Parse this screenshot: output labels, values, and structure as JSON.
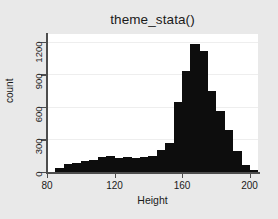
{
  "chart_data": {
    "type": "bar",
    "title": "theme_stata()",
    "xlabel": "Height",
    "ylabel": "count",
    "xlim": [
      80,
      205
    ],
    "ylim": [
      0,
      1270
    ],
    "xticks": [
      80,
      120,
      160,
      200
    ],
    "xtick_labels": [
      "80",
      "120",
      "160",
      "200"
    ],
    "yticks": [
      0,
      300,
      600,
      900,
      1200
    ],
    "ytick_labels": [
      "0",
      "300",
      "600",
      "900",
      "1200"
    ],
    "grid": "horizontal",
    "legend": "none",
    "bin_width": 5,
    "bin_starts": [
      85,
      90,
      95,
      100,
      105,
      110,
      115,
      120,
      125,
      130,
      135,
      140,
      145,
      150,
      155,
      160,
      165,
      170,
      175,
      180,
      185,
      190,
      195,
      200
    ],
    "values": [
      40,
      70,
      85,
      100,
      115,
      140,
      150,
      130,
      135,
      130,
      135,
      145,
      200,
      270,
      640,
      930,
      1180,
      1115,
      745,
      560,
      390,
      190,
      60,
      15
    ],
    "colors": {
      "bar": "#0d0d0d",
      "panel_background": "#ffffff",
      "figure_background": "#e9e9e9",
      "axis": "#4d4d4d",
      "gridline": "#eeeeee",
      "text": "#1a1a1a"
    }
  }
}
